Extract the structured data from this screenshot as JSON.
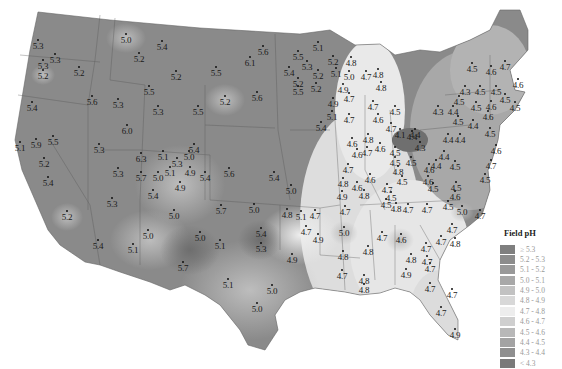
{
  "legend": {
    "title": "Field pH",
    "classes": [
      {
        "label": "≥ 5.3",
        "color": "#7f7f7f"
      },
      {
        "label": "5.2 - 5.3",
        "color": "#8c8c8c"
      },
      {
        "label": "5.1 - 5.2",
        "color": "#999999"
      },
      {
        "label": "5.0 - 5.1",
        "color": "#a8a8a8"
      },
      {
        "label": "4.9 - 5.0",
        "color": "#c2c2c2"
      },
      {
        "label": "4.8 - 4.9",
        "color": "#d8d8d8"
      },
      {
        "label": "4.7 - 4.8",
        "color": "#ededed"
      },
      {
        "label": "4.6 - 4.7",
        "color": "#cfcfcf"
      },
      {
        "label": "4.5 - 4.6",
        "color": "#b8b8b8"
      },
      {
        "label": "4.4 - 4.5",
        "color": "#a3a3a3"
      },
      {
        "label": "4.3 - 4.4",
        "color": "#8f8f8f"
      },
      {
        "label": "< 4.3",
        "color": "#7a7a7a"
      }
    ]
  },
  "stations": [
    {
      "v": "5.3",
      "x": 38,
      "y": 46
    },
    {
      "v": "5.3",
      "x": 55,
      "y": 60
    },
    {
      "v": "5.3",
      "x": 43,
      "y": 66
    },
    {
      "v": "5.2",
      "x": 43,
      "y": 76
    },
    {
      "v": "5.2",
      "x": 79,
      "y": 73
    },
    {
      "v": "5.0",
      "x": 126,
      "y": 40
    },
    {
      "v": "5.4",
      "x": 162,
      "y": 47
    },
    {
      "v": "5.2",
      "x": 139,
      "y": 59
    },
    {
      "v": "5.2",
      "x": 176,
      "y": 77
    },
    {
      "v": "5.6",
      "x": 92,
      "y": 102
    },
    {
      "v": "5.3",
      "x": 118,
      "y": 105
    },
    {
      "v": "5.5",
      "x": 149,
      "y": 92
    },
    {
      "v": "5.3",
      "x": 158,
      "y": 112
    },
    {
      "v": "5.4",
      "x": 32,
      "y": 108
    },
    {
      "v": "5.6",
      "x": 263,
      "y": 52
    },
    {
      "v": "6.1",
      "x": 250,
      "y": 63
    },
    {
      "v": "5.5",
      "x": 216,
      "y": 73
    },
    {
      "v": "5.2",
      "x": 225,
      "y": 102
    },
    {
      "v": "5.6",
      "x": 257,
      "y": 98
    },
    {
      "v": "5.5",
      "x": 198,
      "y": 112
    },
    {
      "v": "5.1",
      "x": 318,
      "y": 48
    },
    {
      "v": "5.5",
      "x": 298,
      "y": 57
    },
    {
      "v": "5.2",
      "x": 333,
      "y": 62
    },
    {
      "v": "5.3",
      "x": 307,
      "y": 67
    },
    {
      "v": "5.4",
      "x": 289,
      "y": 73
    },
    {
      "v": "5.2",
      "x": 318,
      "y": 76
    },
    {
      "v": "5.2",
      "x": 298,
      "y": 84
    },
    {
      "v": "5.2",
      "x": 316,
      "y": 89
    },
    {
      "v": "5.5",
      "x": 298,
      "y": 92
    },
    {
      "v": "5.4",
      "x": 321,
      "y": 128
    },
    {
      "v": "5.1",
      "x": 332,
      "y": 117
    },
    {
      "v": "4.8",
      "x": 351,
      "y": 63
    },
    {
      "v": "5.1",
      "x": 336,
      "y": 74
    },
    {
      "v": "5.0",
      "x": 349,
      "y": 77
    },
    {
      "v": "4.7",
      "x": 366,
      "y": 77
    },
    {
      "v": "4.9",
      "x": 343,
      "y": 90
    },
    {
      "v": "4.7",
      "x": 349,
      "y": 99
    },
    {
      "v": "4.9",
      "x": 333,
      "y": 104
    },
    {
      "v": "4.7",
      "x": 349,
      "y": 120
    },
    {
      "v": "4.8",
      "x": 378,
      "y": 75
    },
    {
      "v": "4.8",
      "x": 381,
      "y": 88
    },
    {
      "v": "4.7",
      "x": 373,
      "y": 107
    },
    {
      "v": "4.6",
      "x": 378,
      "y": 120
    },
    {
      "v": "4.5",
      "x": 395,
      "y": 112
    },
    {
      "v": "4.7",
      "x": 391,
      "y": 129
    },
    {
      "v": "4.5",
      "x": 472,
      "y": 69
    },
    {
      "v": "4.6",
      "x": 491,
      "y": 72
    },
    {
      "v": "4.7",
      "x": 505,
      "y": 67
    },
    {
      "v": "4.6",
      "x": 518,
      "y": 85
    },
    {
      "v": "4.3",
      "x": 465,
      "y": 92
    },
    {
      "v": "4.5",
      "x": 480,
      "y": 92
    },
    {
      "v": "4.5",
      "x": 496,
      "y": 92
    },
    {
      "v": "4.5",
      "x": 505,
      "y": 100
    },
    {
      "v": "4.5",
      "x": 515,
      "y": 108
    },
    {
      "v": "4.5",
      "x": 459,
      "y": 102
    },
    {
      "v": "4.6",
      "x": 491,
      "y": 107
    },
    {
      "v": "4.5",
      "x": 476,
      "y": 108
    },
    {
      "v": "4.3",
      "x": 438,
      "y": 112
    },
    {
      "v": "4.4",
      "x": 453,
      "y": 112
    },
    {
      "v": "4.6",
      "x": 488,
      "y": 117
    },
    {
      "v": "4.5",
      "x": 458,
      "y": 122
    },
    {
      "v": "4.4",
      "x": 473,
      "y": 126
    },
    {
      "v": "4.5",
      "x": 490,
      "y": 134
    },
    {
      "v": "4.4",
      "x": 448,
      "y": 140
    },
    {
      "v": "4.4",
      "x": 460,
      "y": 140
    },
    {
      "v": "4.1",
      "x": 400,
      "y": 135
    },
    {
      "v": "4.4",
      "x": 415,
      "y": 135
    },
    {
      "v": "4.3",
      "x": 420,
      "y": 148
    },
    {
      "v": "4.4",
      "x": 412,
      "y": 137
    },
    {
      "v": "4.5",
      "x": 395,
      "y": 153
    },
    {
      "v": "4.5",
      "x": 411,
      "y": 163
    },
    {
      "v": "4.5",
      "x": 395,
      "y": 163
    },
    {
      "v": "4.4",
      "x": 436,
      "y": 166
    },
    {
      "v": "4.5",
      "x": 455,
      "y": 167
    },
    {
      "v": "4.6",
      "x": 496,
      "y": 151
    },
    {
      "v": "4.7",
      "x": 491,
      "y": 166
    },
    {
      "v": "4.6",
      "x": 429,
      "y": 170
    },
    {
      "v": "4.6",
      "x": 428,
      "y": 182
    },
    {
      "v": "4.5",
      "x": 433,
      "y": 189
    },
    {
      "v": "4.5",
      "x": 456,
      "y": 188
    },
    {
      "v": "4.6",
      "x": 455,
      "y": 197
    },
    {
      "v": "4.5",
      "x": 448,
      "y": 207
    },
    {
      "v": "5.0",
      "x": 462,
      "y": 212
    },
    {
      "v": "4.7",
      "x": 480,
      "y": 216
    },
    {
      "v": "4.4",
      "x": 444,
      "y": 157
    },
    {
      "v": "4.5",
      "x": 485,
      "y": 180
    },
    {
      "v": "4.6",
      "x": 352,
      "y": 144
    },
    {
      "v": "4.6",
      "x": 357,
      "y": 155
    },
    {
      "v": "4.7",
      "x": 367,
      "y": 153
    },
    {
      "v": "4.8",
      "x": 368,
      "y": 140
    },
    {
      "v": "4.6",
      "x": 380,
      "y": 149
    },
    {
      "v": "4.7",
      "x": 348,
      "y": 170
    },
    {
      "v": "4.8",
      "x": 343,
      "y": 184
    },
    {
      "v": "4.9",
      "x": 342,
      "y": 197
    },
    {
      "v": "4.6",
      "x": 357,
      "y": 188
    },
    {
      "v": "4.6",
      "x": 370,
      "y": 180
    },
    {
      "v": "4.8",
      "x": 364,
      "y": 196
    },
    {
      "v": "4.7",
      "x": 387,
      "y": 190
    },
    {
      "v": "4.8",
      "x": 398,
      "y": 172
    },
    {
      "v": "4.5",
      "x": 402,
      "y": 182
    },
    {
      "v": "4.5",
      "x": 391,
      "y": 198
    },
    {
      "v": "4.8",
      "x": 396,
      "y": 209
    },
    {
      "v": "4.7",
      "x": 408,
      "y": 210
    },
    {
      "v": "4.7",
      "x": 427,
      "y": 210
    },
    {
      "v": "4.5",
      "x": 386,
      "y": 205
    },
    {
      "v": "5.1",
      "x": 20,
      "y": 148
    },
    {
      "v": "5.9",
      "x": 36,
      "y": 145
    },
    {
      "v": "5.5",
      "x": 53,
      "y": 142
    },
    {
      "v": "5.2",
      "x": 44,
      "y": 164
    },
    {
      "v": "5.4",
      "x": 48,
      "y": 183
    },
    {
      "v": "6.0",
      "x": 127,
      "y": 131
    },
    {
      "v": "5.3",
      "x": 99,
      "y": 150
    },
    {
      "v": "6.3",
      "x": 141,
      "y": 159
    },
    {
      "v": "5.3",
      "x": 118,
      "y": 174
    },
    {
      "v": "5.7",
      "x": 141,
      "y": 178
    },
    {
      "v": "5.4",
      "x": 153,
      "y": 196
    },
    {
      "v": "5.3",
      "x": 112,
      "y": 204
    },
    {
      "v": "5.2",
      "x": 67,
      "y": 217
    },
    {
      "v": "5.1",
      "x": 163,
      "y": 157
    },
    {
      "v": "5.3",
      "x": 177,
      "y": 164
    },
    {
      "v": "5.0",
      "x": 189,
      "y": 157
    },
    {
      "v": "5.1",
      "x": 170,
      "y": 173
    },
    {
      "v": "4.9",
      "x": 190,
      "y": 173
    },
    {
      "v": "5.0",
      "x": 158,
      "y": 178
    },
    {
      "v": "4.9",
      "x": 180,
      "y": 188
    },
    {
      "v": "5.4",
      "x": 194,
      "y": 150
    },
    {
      "v": "5.4",
      "x": 205,
      "y": 178
    },
    {
      "v": "5.0",
      "x": 174,
      "y": 216
    },
    {
      "v": "5.6",
      "x": 229,
      "y": 174
    },
    {
      "v": "5.4",
      "x": 274,
      "y": 178
    },
    {
      "v": "5.0",
      "x": 291,
      "y": 191
    },
    {
      "v": "5.7",
      "x": 221,
      "y": 211
    },
    {
      "v": "5.0",
      "x": 254,
      "y": 210
    },
    {
      "v": "4.8",
      "x": 287,
      "y": 215
    },
    {
      "v": "5.1",
      "x": 301,
      "y": 217
    },
    {
      "v": "4.7",
      "x": 315,
      "y": 216
    },
    {
      "v": "4.7",
      "x": 306,
      "y": 232
    },
    {
      "v": "4.9",
      "x": 318,
      "y": 240
    },
    {
      "v": "5.4",
      "x": 261,
      "y": 234
    },
    {
      "v": "5.3",
      "x": 261,
      "y": 249
    },
    {
      "v": "4.9",
      "x": 292,
      "y": 260
    },
    {
      "v": "5.0",
      "x": 148,
      "y": 236
    },
    {
      "v": "5.1",
      "x": 133,
      "y": 250
    },
    {
      "v": "5.4",
      "x": 98,
      "y": 246
    },
    {
      "v": "5.0",
      "x": 200,
      "y": 238
    },
    {
      "v": "5.7",
      "x": 183,
      "y": 268
    },
    {
      "v": "5.1",
      "x": 220,
      "y": 246
    },
    {
      "v": "5.1",
      "x": 228,
      "y": 285
    },
    {
      "v": "5.0",
      "x": 272,
      "y": 291
    },
    {
      "v": "5.0",
      "x": 257,
      "y": 309
    },
    {
      "v": "4.7",
      "x": 345,
      "y": 212
    },
    {
      "v": "5.0",
      "x": 344,
      "y": 233
    },
    {
      "v": "4.8",
      "x": 343,
      "y": 257
    },
    {
      "v": "4.7",
      "x": 342,
      "y": 276
    },
    {
      "v": "4.8",
      "x": 368,
      "y": 252
    },
    {
      "v": "4.8",
      "x": 364,
      "y": 281
    },
    {
      "v": "4.8",
      "x": 364,
      "y": 290
    },
    {
      "v": "4.7",
      "x": 382,
      "y": 238
    },
    {
      "v": "4.6",
      "x": 401,
      "y": 240
    },
    {
      "v": "4.7",
      "x": 426,
      "y": 249
    },
    {
      "v": "4.8",
      "x": 411,
      "y": 260
    },
    {
      "v": "4.9",
      "x": 406,
      "y": 275
    },
    {
      "v": "4.7",
      "x": 430,
      "y": 269
    },
    {
      "v": "4.7",
      "x": 430,
      "y": 289
    },
    {
      "v": "4.7",
      "x": 452,
      "y": 295
    },
    {
      "v": "4.7",
      "x": 441,
      "y": 313
    },
    {
      "v": "4.9",
      "x": 455,
      "y": 335
    },
    {
      "v": "4.7",
      "x": 452,
      "y": 230
    },
    {
      "v": "4.7",
      "x": 441,
      "y": 242
    },
    {
      "v": "4.8",
      "x": 455,
      "y": 244
    },
    {
      "v": "4.7",
      "x": 427,
      "y": 262
    }
  ]
}
